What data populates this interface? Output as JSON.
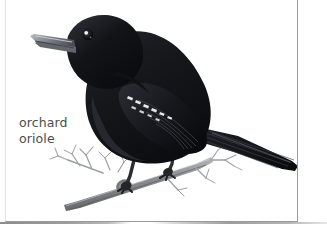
{
  "page": {
    "background_color": "#ffffff",
    "card": {
      "border_color": "#9a9a9a",
      "background_color": "#ffffff"
    },
    "separator": {
      "name": "page-fold-shadow",
      "color": "#9c9c9c"
    }
  },
  "caption": {
    "line1": "orchard",
    "line2": "oriole",
    "full_text": "orchard oriole",
    "color": "#4c4c4c"
  },
  "illustration": {
    "subject": "orchard-oriole-bird",
    "description": "Black perching bird with gray pointed beak facing left, perched on a bare twig branch",
    "style": "field-guide-illustration",
    "colors": {
      "plumage_black": "#15161a",
      "plumage_highlight": "#4a4d55",
      "beak_gray": "#7d828a",
      "eye_black": "#0b0c0e",
      "eye_highlight": "#f2f2f2",
      "wingbar_white": "#e8e8e8",
      "branch_gray": "#8b8d90",
      "twig_gray": "#9ea0a3"
    },
    "parts": [
      "head",
      "beak",
      "eye",
      "breast",
      "wing",
      "wing-bars",
      "tail",
      "legs",
      "feet",
      "branch",
      "twigs"
    ]
  }
}
